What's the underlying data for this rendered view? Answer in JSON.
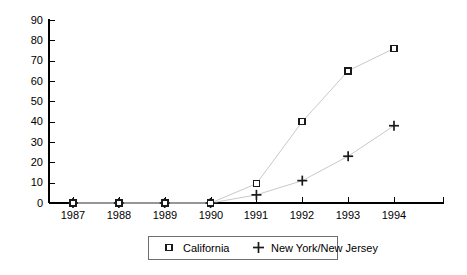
{
  "chart_data": {
    "type": "line",
    "title": "",
    "subtitle": "",
    "xlabel": "",
    "ylabel": "",
    "categories": [
      "1987",
      "1988",
      "1989",
      "1990",
      "1991",
      "1992",
      "1993",
      "1994"
    ],
    "x": [
      1987,
      1988,
      1989,
      1990,
      1991,
      1992,
      1993,
      1994
    ],
    "series": [
      {
        "name": "California",
        "marker": "open-square",
        "values": [
          0,
          0,
          0,
          0,
          9.5,
          40,
          65,
          76
        ]
      },
      {
        "name": "New York/New Jersey",
        "marker": "plus",
        "values": [
          0,
          0,
          0,
          0,
          4,
          11,
          23,
          38
        ]
      }
    ],
    "ylim": [
      0,
      90
    ],
    "yticks": [
      0,
      10,
      20,
      30,
      40,
      50,
      60,
      70,
      80,
      90
    ],
    "ytick_labels": [
      "0",
      "10",
      "20",
      "30",
      "40",
      "50",
      "60",
      "70",
      "80",
      "90"
    ],
    "xtick_labels": [
      "1987",
      "1988",
      "1989",
      "1990",
      "1991",
      "1992",
      "1993",
      "1994"
    ],
    "grid": false,
    "legend_position": "bottom-center",
    "legend_entries": [
      {
        "label": "California",
        "marker": "open-square"
      },
      {
        "label": "New York/New Jersey",
        "marker": "plus"
      }
    ],
    "colors": {
      "line": "#c9c9c9",
      "marker": "#1a1a1a",
      "axis": "#000000",
      "legend_border": "#6f6f6f",
      "background": "#ffffff"
    }
  }
}
